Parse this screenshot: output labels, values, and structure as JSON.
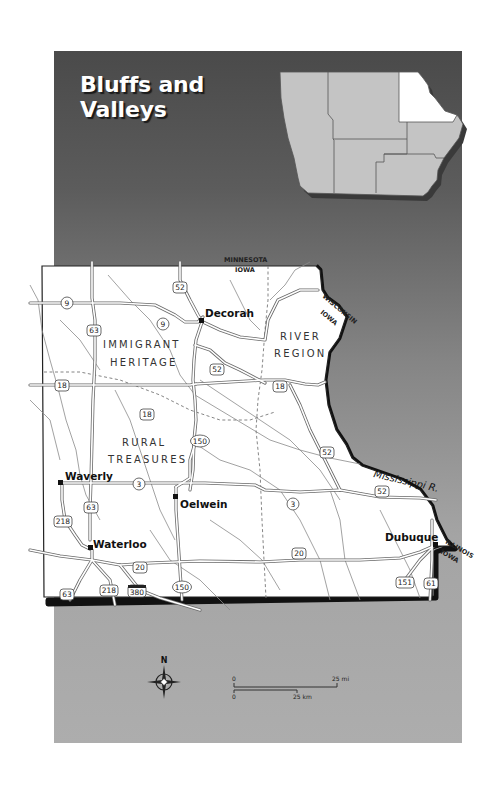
{
  "title": {
    "line1": "Bluffs and",
    "line2": "Valleys"
  },
  "inset_map": {
    "state": "Iowa",
    "highlighted_region": "northeast",
    "colors": {
      "highlight": "#ffffff",
      "other": "#c4c4c4"
    }
  },
  "regions": [
    {
      "line1": "IMMIGRANT",
      "line2": "HERITAGE"
    },
    {
      "line1": "RIVER",
      "line2": "REGION"
    },
    {
      "line1": "RURAL",
      "line2": "TREASURES"
    }
  ],
  "cities": [
    {
      "name": "Decorah"
    },
    {
      "name": "Waverly"
    },
    {
      "name": "Oelwein"
    },
    {
      "name": "Waterloo"
    },
    {
      "name": "Dubuque"
    }
  ],
  "state_borders": {
    "north_other": "MINNESOTA",
    "north_iowa": "IOWA",
    "east_other": "WISCONSIN",
    "east_iowa": "IOWA",
    "se_other": "ILLINOIS",
    "se_iowa": "IOWA"
  },
  "river_label": "Mississippi R.",
  "route_shields": {
    "r9a": "9",
    "r9b": "9",
    "r52a": "52",
    "r52b": "52",
    "r52c": "52",
    "r52d": "52",
    "r63a": "63",
    "r63b": "63",
    "r63c": "63",
    "r18a": "18",
    "r18b": "18",
    "r18c": "18",
    "r150a": "150",
    "r150b": "150",
    "r3a": "3",
    "r3b": "3",
    "r218a": "218",
    "r218b": "218",
    "r20a": "20",
    "r20b": "20",
    "r380": "380",
    "r151": "151",
    "r61": "61"
  },
  "compass": {
    "north_label": "N"
  },
  "scale": {
    "mi_zero": "0",
    "mi_label": "25 mi",
    "km_zero": "0",
    "km_label": "25 km"
  },
  "colors": {
    "panel_top": "#4a4a4a",
    "panel_bottom": "#adadad",
    "land": "#ffffff",
    "border": "#111111"
  }
}
